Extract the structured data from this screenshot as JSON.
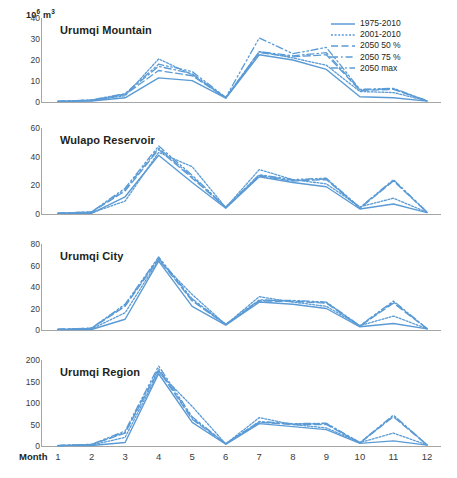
{
  "figure": {
    "unit_label_base": "10",
    "unit_label_exp": "6",
    "unit_label_tail": " m",
    "unit_label_tail_exp": "3",
    "xaxis_label": "Month"
  },
  "legend": {
    "position": "top-right",
    "items": [
      {
        "label": "1975-2010",
        "style": "solid"
      },
      {
        "label": "2001-2010",
        "style": "dotted"
      },
      {
        "label": "2050 50 %",
        "style": "dashed"
      },
      {
        "label": "2050 75 %",
        "style": "dashdot"
      },
      {
        "label": "2050 max",
        "style": "dashdotdot"
      }
    ]
  },
  "colors": {
    "line": "#5B9BD5",
    "axis": "#a6a6a6",
    "text": "#231f20",
    "tick_text": "#3b3b3b"
  },
  "chart_data": [
    {
      "type": "line",
      "title": "Urumqi Mountain",
      "xlabel": "Month",
      "ylabel": "10^6 m^3",
      "x": [
        1,
        2,
        3,
        4,
        5,
        6,
        7,
        8,
        9,
        10,
        11,
        12
      ],
      "categories": [
        "1",
        "2",
        "3",
        "4",
        "5",
        "6",
        "7",
        "8",
        "9",
        "10",
        "11",
        "12"
      ],
      "ylim": [
        0,
        40
      ],
      "yticks": [
        0,
        10,
        20,
        30,
        40
      ],
      "grid": false,
      "series": [
        {
          "name": "1975-2010",
          "style": "solid",
          "values": [
            0.3,
            0.5,
            2.0,
            11.5,
            10.2,
            1.8,
            22.5,
            20.0,
            15.5,
            2.5,
            2.0,
            0.4
          ]
        },
        {
          "name": "2001-2010",
          "style": "dotted",
          "values": [
            0.3,
            0.6,
            3.0,
            20.5,
            13.0,
            2.0,
            24.0,
            21.0,
            17.5,
            5.0,
            4.5,
            0.5
          ]
        },
        {
          "name": "2050 50 %",
          "style": "dashed",
          "values": [
            0.3,
            0.8,
            3.5,
            15.0,
            12.5,
            2.0,
            23.5,
            21.5,
            22.5,
            5.5,
            6.0,
            0.5
          ]
        },
        {
          "name": "2050 75 %",
          "style": "dashdot",
          "values": [
            0.3,
            0.9,
            3.8,
            17.0,
            13.5,
            2.0,
            24.0,
            22.0,
            23.5,
            5.8,
            6.3,
            0.5
          ]
        },
        {
          "name": "2050 max",
          "style": "dashdotdot",
          "values": [
            0.3,
            1.0,
            4.0,
            18.0,
            14.5,
            2.2,
            30.5,
            23.0,
            26.0,
            6.0,
            6.5,
            0.6
          ]
        }
      ]
    },
    {
      "type": "line",
      "title": "Wulapo Reservoir",
      "xlabel": "Month",
      "ylabel": "10^6 m^3",
      "x": [
        1,
        2,
        3,
        4,
        5,
        6,
        7,
        8,
        9,
        10,
        11,
        12
      ],
      "categories": [
        "1",
        "2",
        "3",
        "4",
        "5",
        "6",
        "7",
        "8",
        "9",
        "10",
        "11",
        "12"
      ],
      "ylim": [
        0,
        60
      ],
      "yticks": [
        0,
        20,
        40,
        60
      ],
      "grid": false,
      "series": [
        {
          "name": "1975-2010",
          "style": "solid",
          "values": [
            0.5,
            0.5,
            12.0,
            41.0,
            22.0,
            4.0,
            26.0,
            22.0,
            19.0,
            3.5,
            7.0,
            1.0
          ]
        },
        {
          "name": "2001-2010",
          "style": "dotted",
          "values": [
            0.5,
            0.8,
            9.0,
            43.0,
            33.0,
            4.5,
            31.0,
            24.0,
            21.0,
            5.0,
            11.0,
            1.2
          ]
        },
        {
          "name": "2050 50 %",
          "style": "dashed",
          "values": [
            0.5,
            1.2,
            16.0,
            45.0,
            25.0,
            4.5,
            26.5,
            23.0,
            24.0,
            4.0,
            23.0,
            1.2
          ]
        },
        {
          "name": "2050 75 %",
          "style": "dashdot",
          "values": [
            0.5,
            1.4,
            17.0,
            46.0,
            26.0,
            4.6,
            27.0,
            23.5,
            24.5,
            4.2,
            23.5,
            1.3
          ]
        },
        {
          "name": "2050 max",
          "style": "dashdotdot",
          "values": [
            0.5,
            1.5,
            18.0,
            47.5,
            27.0,
            4.8,
            27.5,
            24.0,
            25.0,
            4.5,
            24.0,
            1.4
          ]
        }
      ]
    },
    {
      "type": "line",
      "title": "Urumqi City",
      "xlabel": "Month",
      "ylabel": "10^6 m^3",
      "x": [
        1,
        2,
        3,
        4,
        5,
        6,
        7,
        8,
        9,
        10,
        11,
        12
      ],
      "categories": [
        "1",
        "2",
        "3",
        "4",
        "5",
        "6",
        "7",
        "8",
        "9",
        "10",
        "11",
        "12"
      ],
      "ylim": [
        0,
        80
      ],
      "yticks": [
        0,
        20,
        40,
        60,
        80
      ],
      "grid": false,
      "series": [
        {
          "name": "1975-2010",
          "style": "solid",
          "values": [
            0.5,
            0.5,
            10.0,
            64.0,
            22.0,
            4.5,
            26.0,
            24.0,
            20.0,
            3.0,
            6.0,
            1.0
          ]
        },
        {
          "name": "2001-2010",
          "style": "dotted",
          "values": [
            0.5,
            1.0,
            16.0,
            65.0,
            33.0,
            5.0,
            31.0,
            26.0,
            22.0,
            4.0,
            13.0,
            1.2
          ]
        },
        {
          "name": "2050 50 %",
          "style": "dashed",
          "values": [
            0.5,
            1.5,
            22.0,
            66.0,
            27.0,
            5.0,
            27.0,
            26.5,
            25.0,
            3.5,
            25.0,
            1.2
          ]
        },
        {
          "name": "2050 75 %",
          "style": "dashdot",
          "values": [
            0.5,
            1.7,
            23.0,
            67.0,
            28.0,
            5.2,
            27.5,
            27.0,
            25.5,
            3.7,
            26.0,
            1.3
          ]
        },
        {
          "name": "2050 max",
          "style": "dashdotdot",
          "values": [
            0.5,
            1.8,
            24.0,
            68.0,
            29.0,
            5.4,
            28.0,
            27.5,
            26.0,
            4.0,
            27.0,
            1.4
          ]
        }
      ]
    },
    {
      "type": "line",
      "title": "Urumqi Region",
      "xlabel": "Month",
      "ylabel": "10^6 m^3",
      "x": [
        1,
        2,
        3,
        4,
        5,
        6,
        7,
        8,
        9,
        10,
        11,
        12
      ],
      "categories": [
        "1",
        "2",
        "3",
        "4",
        "5",
        "6",
        "7",
        "8",
        "9",
        "10",
        "11",
        "12"
      ],
      "ylim": [
        0,
        200
      ],
      "yticks": [
        0,
        50,
        100,
        150,
        200
      ],
      "grid": false,
      "series": [
        {
          "name": "1975-2010",
          "style": "solid",
          "values": [
            1.0,
            1.0,
            8.0,
            168.0,
            55.0,
            4.0,
            52.0,
            45.0,
            38.0,
            6.0,
            12.0,
            2.0
          ]
        },
        {
          "name": "2001-2010",
          "style": "dotted",
          "values": [
            1.0,
            2.0,
            20.0,
            172.0,
            92.0,
            5.0,
            66.0,
            50.0,
            42.0,
            8.0,
            30.0,
            2.5
          ]
        },
        {
          "name": "2050 50 %",
          "style": "dashed",
          "values": [
            1.0,
            3.0,
            30.0,
            176.0,
            62.0,
            5.0,
            55.0,
            50.0,
            50.0,
            7.0,
            68.0,
            2.5
          ]
        },
        {
          "name": "2050 75 %",
          "style": "dashdot",
          "values": [
            1.0,
            3.5,
            32.0,
            180.0,
            65.0,
            5.2,
            56.0,
            51.0,
            52.0,
            7.5,
            70.0,
            2.8
          ]
        },
        {
          "name": "2050 max",
          "style": "dashdotdot",
          "values": [
            1.0,
            4.0,
            35.0,
            186.0,
            68.0,
            5.5,
            57.0,
            52.0,
            53.0,
            8.0,
            72.0,
            3.0
          ]
        }
      ]
    }
  ]
}
